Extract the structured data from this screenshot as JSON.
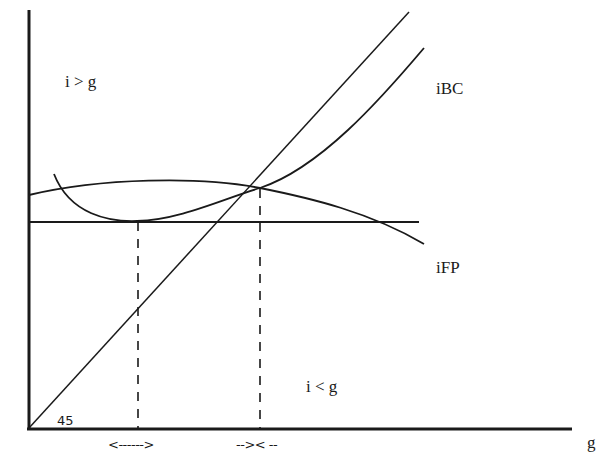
{
  "diagram": {
    "type": "economics-phase-diagram",
    "axes": {
      "x_label": "g",
      "y_label": ""
    },
    "regions": {
      "upper_left": "i > g",
      "lower_right": "i < g"
    },
    "curves": [
      {
        "id": "iBC",
        "label": "iBC",
        "shape": "U-shaped, rising steeply to the right"
      },
      {
        "id": "iFP",
        "label": "iFP",
        "shape": "inverted-U hump, declining to the right"
      },
      {
        "id": "45deg",
        "label": "45",
        "shape": "45-degree line from origin"
      },
      {
        "id": "horizontal",
        "label": "",
        "shape": "horizontal reference line"
      }
    ],
    "angle_label": "45",
    "interval_markers": {
      "left": "<------>",
      "right": "-->< --"
    },
    "colors": {
      "line": "#1a1a1a",
      "background": "#ffffff"
    }
  }
}
